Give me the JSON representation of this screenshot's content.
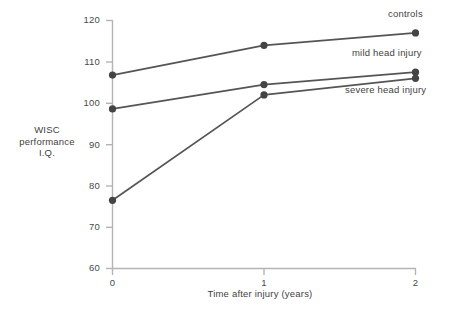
{
  "chart_data": {
    "type": "line",
    "title": "",
    "xlabel": "Time after injury (years)",
    "ylabel": "WISC performance I.Q.",
    "ylabel_lines": [
      "WISC",
      "performance",
      "I.Q."
    ],
    "x": [
      0,
      1,
      2
    ],
    "xlim": [
      0,
      2
    ],
    "ylim": [
      60,
      120
    ],
    "xticks": [
      "0",
      "1",
      "2"
    ],
    "yticks": [
      "60",
      "70",
      "80",
      "90",
      "100",
      "110",
      "120"
    ],
    "grid": false,
    "legend_position": "inline-right",
    "series": [
      {
        "name": "controls",
        "values": [
          106.8,
          114.0,
          117.0
        ],
        "label_position": "above"
      },
      {
        "name": "mild head injury",
        "values": [
          98.6,
          104.5,
          107.5
        ],
        "label_position": "above"
      },
      {
        "name": "severe head injury",
        "values": [
          76.5,
          102.0,
          106.0
        ],
        "label_position": "below"
      }
    ],
    "colors": {
      "line": "#555555",
      "marker": "#444444",
      "axis": "#b4b4b4",
      "background": "#ffffff",
      "text": "#3f3f3f"
    }
  },
  "labels": {
    "controls": "controls",
    "mild": "mild head injury",
    "severe": "severe head injury"
  },
  "yticks": {
    "t120": "120",
    "t110": "110",
    "t100": "100",
    "t90": "90",
    "t80": "80",
    "t70": "70",
    "t60": "60"
  },
  "xticks": {
    "t0": "0",
    "t1": "1",
    "t2": "2"
  },
  "axis_titles": {
    "y_line1": "WISC",
    "y_line2": "performance",
    "y_line3": "I.Q.",
    "x": "Time after injury (years)"
  }
}
